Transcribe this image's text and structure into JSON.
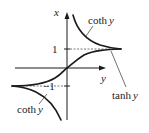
{
  "diagram": {
    "type": "function-graph",
    "axes": {
      "vertical_label": "x",
      "horizontal_label": "y",
      "tick_labels": [
        "1",
        "−1"
      ]
    },
    "curves": [
      {
        "name": "coth_upper",
        "label_func": "coth",
        "label_var": "y"
      },
      {
        "name": "tanh",
        "label_func": "tanh",
        "label_var": "y"
      },
      {
        "name": "coth_lower",
        "label_func": "coth",
        "label_var": "y"
      }
    ],
    "asymptotes": [
      "x = 1",
      "x = −1"
    ],
    "colors": {
      "line": "#1a1a1a",
      "dash": "#555555",
      "text": "#222222"
    }
  }
}
